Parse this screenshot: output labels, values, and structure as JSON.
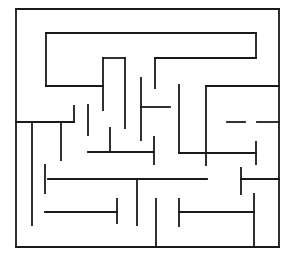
{
  "diagram": {
    "type": "maze",
    "width": 295,
    "height": 255,
    "stroke_color": "#1a1a1a",
    "background": "#ffffff",
    "border": {
      "x1": 16,
      "y1": 9,
      "x2": 279,
      "y2": 247
    },
    "walls": [
      [
        46,
        33,
        256,
        33
      ],
      [
        256,
        33,
        256,
        58
      ],
      [
        256,
        58,
        155,
        58
      ],
      [
        155,
        58,
        155,
        88
      ],
      [
        46,
        33,
        46,
        86
      ],
      [
        46,
        86,
        103,
        86
      ],
      [
        103,
        58,
        125,
        58
      ],
      [
        103,
        58,
        103,
        110
      ],
      [
        125,
        58,
        125,
        128
      ],
      [
        141,
        78,
        141,
        140
      ],
      [
        141,
        107,
        170,
        107
      ],
      [
        179,
        85,
        179,
        153
      ],
      [
        179,
        153,
        256,
        153
      ],
      [
        256,
        142,
        256,
        164
      ],
      [
        206,
        86,
        279,
        86
      ],
      [
        206,
        86,
        206,
        165
      ],
      [
        227,
        122,
        245,
        122
      ],
      [
        257,
        122,
        279,
        122
      ],
      [
        16,
        122,
        74,
        122
      ],
      [
        74,
        106,
        74,
        122
      ],
      [
        32,
        122,
        32,
        225
      ],
      [
        61,
        122,
        61,
        160
      ],
      [
        88,
        105,
        88,
        135
      ],
      [
        88,
        152,
        154,
        152
      ],
      [
        110,
        128,
        110,
        152
      ],
      [
        154,
        137,
        154,
        164
      ],
      [
        48,
        179,
        207,
        179
      ],
      [
        45,
        165,
        45,
        193
      ],
      [
        137,
        179,
        137,
        225
      ],
      [
        45,
        212,
        117,
        212
      ],
      [
        117,
        199,
        117,
        223
      ],
      [
        156,
        199,
        156,
        247
      ],
      [
        179,
        212,
        254,
        212
      ],
      [
        179,
        199,
        179,
        226
      ],
      [
        254,
        194,
        254,
        247
      ],
      [
        241,
        179,
        279,
        179
      ],
      [
        241,
        168,
        241,
        194
      ]
    ]
  }
}
